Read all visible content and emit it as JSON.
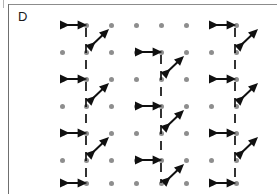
{
  "figure": {
    "panel_label": "D",
    "type": "lattice-diagram",
    "background_color": "#ffffff",
    "frame_color": "#8c8c8c"
  },
  "lattice": {
    "dot_color": "#8e8e8e",
    "dot_radius_px": 2.5,
    "columns": 8,
    "rows": 7,
    "x_positions": [
      62,
      86,
      111,
      136,
      161,
      186,
      211,
      236
    ],
    "y_positions": [
      25,
      52,
      79,
      106,
      133,
      160,
      183
    ]
  },
  "marks": {
    "stroke_color": "#101010",
    "horizontal_arrow": {
      "name": "double-headed-horizontal-arrow",
      "count": 9,
      "length_px": 24,
      "style": "solid double-headed"
    },
    "vertical_bond": {
      "name": "vertical-dashed-line",
      "count": 18,
      "style": "dashed"
    },
    "diagonal_arrow": {
      "name": "double-headed-diagonal-arrow",
      "count": 9,
      "direction": "up-right / down-left",
      "style": "solid double-headed"
    }
  },
  "chart_data": {
    "type": "scatter",
    "title": "D",
    "xlabel": "",
    "ylabel": "",
    "grid": false,
    "legend_position": "none",
    "x": [
      62,
      86,
      111,
      136,
      161,
      186,
      211,
      236
    ],
    "y": [
      25,
      52,
      79,
      106,
      133,
      160,
      183
    ],
    "motif_groups": [
      {
        "name": "group-left",
        "anchor_column_index": 1,
        "horizontal_arrows": [
          {
            "x1": 62,
            "x2": 86,
            "y": 25
          },
          {
            "x1": 62,
            "x2": 86,
            "y": 79
          },
          {
            "x1": 62,
            "x2": 86,
            "y": 133
          },
          {
            "x1": 62,
            "x2": 86,
            "y": 183
          }
        ],
        "vertical_dashed": [
          {
            "x": 86,
            "y1": 28,
            "y2": 76
          },
          {
            "x": 86,
            "y1": 82,
            "y2": 130
          },
          {
            "x": 86,
            "y1": 136,
            "y2": 180
          }
        ],
        "diagonal_arrows": [
          {
            "x1": 90,
            "y1": 47,
            "x2": 108,
            "y2": 30
          },
          {
            "x1": 90,
            "y1": 101,
            "x2": 108,
            "y2": 84
          },
          {
            "x1": 90,
            "y1": 155,
            "x2": 108,
            "y2": 138
          }
        ]
      },
      {
        "name": "group-middle",
        "anchor_column_index": 4,
        "horizontal_arrows": [
          {
            "x1": 137,
            "x2": 161,
            "y": 52
          },
          {
            "x1": 137,
            "x2": 161,
            "y": 106
          },
          {
            "x1": 137,
            "x2": 161,
            "y": 160
          }
        ],
        "vertical_dashed": [
          {
            "x": 161,
            "y1": 55,
            "y2": 103
          },
          {
            "x": 161,
            "y1": 109,
            "y2": 157
          },
          {
            "x": 161,
            "y1": 163,
            "y2": 183
          }
        ],
        "diagonal_arrows": [
          {
            "x1": 165,
            "y1": 74,
            "x2": 183,
            "y2": 57
          },
          {
            "x1": 165,
            "y1": 128,
            "x2": 183,
            "y2": 111
          },
          {
            "x1": 165,
            "y1": 182,
            "x2": 183,
            "y2": 165
          }
        ]
      },
      {
        "name": "group-right",
        "anchor_column_index": 6,
        "horizontal_arrows": [
          {
            "x1": 211,
            "x2": 235,
            "y": 25
          },
          {
            "x1": 211,
            "x2": 235,
            "y": 79
          },
          {
            "x1": 211,
            "x2": 235,
            "y": 133
          },
          {
            "x1": 211,
            "x2": 235,
            "y": 183
          }
        ],
        "vertical_dashed": [
          {
            "x": 235,
            "y1": 28,
            "y2": 76
          },
          {
            "x": 235,
            "y1": 82,
            "y2": 130
          },
          {
            "x": 235,
            "y1": 136,
            "y2": 180
          }
        ],
        "diagonal_arrows": [
          {
            "x1": 239,
            "y1": 47,
            "x2": 257,
            "y2": 30
          },
          {
            "x1": 239,
            "y1": 101,
            "x2": 257,
            "y2": 84
          },
          {
            "x1": 239,
            "y1": 155,
            "x2": 257,
            "y2": 138
          }
        ]
      }
    ]
  }
}
